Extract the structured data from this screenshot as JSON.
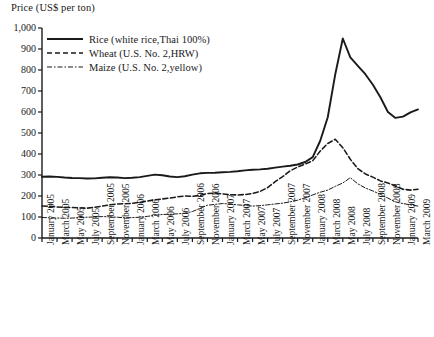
{
  "chart_data": {
    "type": "line",
    "title": "Price (US$ per ton)",
    "xlabel": "",
    "ylabel": "Price (US$ per ton)",
    "ylim": [
      0,
      1000
    ],
    "ytick_step": 100,
    "ytick_labels": [
      "1,000",
      "900",
      "800",
      "700",
      "600",
      "500",
      "400",
      "300",
      "200",
      "100",
      "0"
    ],
    "grid": false,
    "legend_position": "top-left",
    "x_tick_interval_months": 2,
    "x_range": [
      "January 2005",
      "March 2009"
    ],
    "categories": [
      "January 2005",
      "February 2005",
      "March 2005",
      "April 2005",
      "May 2005",
      "June 2005",
      "July 2005",
      "August 2005",
      "September 2005",
      "October 2005",
      "November 2005",
      "December 2005",
      "January 2006",
      "February 2006",
      "March 2006",
      "April 2006",
      "May 2006",
      "June 2006",
      "July 2006",
      "August 2006",
      "September 2006",
      "October 2006",
      "November 2006",
      "December 2006",
      "January 2007",
      "February 2007",
      "March 2007",
      "April 2007",
      "May 2007",
      "June 2007",
      "July 2007",
      "August 2007",
      "September 2007",
      "October 2007",
      "November 2007",
      "December 2007",
      "January 2008",
      "February 2008",
      "March 2008",
      "April 2008",
      "May 2008",
      "June 2008",
      "July 2008",
      "August 2008",
      "September 2008",
      "October 2008",
      "November 2008",
      "December 2008",
      "January 2009",
      "February 2009",
      "March 2009"
    ],
    "xtick_labels": [
      "January 2005",
      "March 2005",
      "May 2005",
      "July 2005",
      "September 2005",
      "November 2005",
      "January 2006",
      "March 2006",
      "May 2006",
      "July 2006",
      "September 2006",
      "November 2006",
      "January 2007",
      "March 2007",
      "May 2007",
      "July 2007",
      "September 2007",
      "November 2007",
      "January 2008",
      "March 2008",
      "May 2008",
      "July 2008",
      "September 2008",
      "November 2008",
      "January 2009",
      "March 2009"
    ],
    "series": [
      {
        "name": "Rice (white rice,Thai 100%)",
        "style": "solid",
        "values": [
          292,
          293,
          291,
          288,
          286,
          285,
          283,
          284,
          287,
          289,
          288,
          285,
          287,
          290,
          296,
          302,
          299,
          293,
          290,
          294,
          302,
          308,
          310,
          311,
          313,
          315,
          318,
          322,
          325,
          327,
          330,
          335,
          340,
          344,
          350,
          362,
          385,
          463,
          575,
          780,
          950,
          860,
          820,
          780,
          730,
          670,
          600,
          572,
          578,
          598,
          612
        ]
      },
      {
        "name": "Wheat (U.S. No. 2,HRW)",
        "style": "dashed",
        "values": [
          152,
          151,
          148,
          146,
          145,
          143,
          142,
          146,
          152,
          158,
          162,
          163,
          165,
          170,
          176,
          182,
          186,
          190,
          196,
          200,
          198,
          203,
          212,
          214,
          210,
          206,
          205,
          207,
          212,
          222,
          240,
          268,
          292,
          320,
          338,
          352,
          368,
          414,
          450,
          470,
          430,
          375,
          330,
          305,
          290,
          272,
          262,
          248,
          232,
          228,
          232
        ]
      },
      {
        "name": "Maize (U.S. No. 2,yellow)",
        "style": "dash-dot",
        "values": [
          98,
          96,
          95,
          94,
          95,
          97,
          99,
          100,
          102,
          101,
          99,
          96,
          97,
          99,
          103,
          108,
          112,
          113,
          115,
          118,
          126,
          141,
          156,
          160,
          164,
          162,
          158,
          155,
          152,
          154,
          158,
          162,
          166,
          172,
          180,
          192,
          205,
          218,
          228,
          246,
          262,
          287,
          258,
          238,
          224,
          208,
          190,
          172,
          164,
          158,
          152
        ]
      }
    ]
  },
  "legend": {
    "items": [
      {
        "label": "Rice (white rice,Thai 100%)",
        "swatch": "solid-line-swatch"
      },
      {
        "label": "Wheat (U.S. No. 2,HRW)",
        "swatch": "dashed-line-swatch"
      },
      {
        "label": "Maize (U.S. No. 2,yellow)",
        "swatch": "dash-dot-line-swatch"
      }
    ]
  },
  "colors": {
    "line": "#1a1a1a",
    "axis": "#1a1a1a",
    "background": "#ffffff"
  }
}
